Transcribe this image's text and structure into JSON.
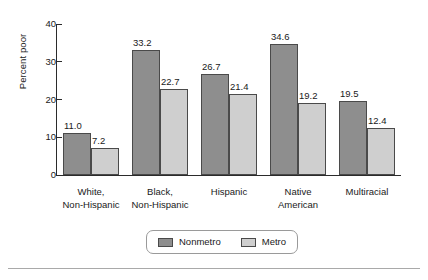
{
  "chart_data": {
    "type": "bar",
    "title": "",
    "xlabel": "",
    "ylabel": "Percent poor",
    "ylim": [
      0,
      40
    ],
    "yticks": [
      "0",
      "10",
      "20",
      "30",
      "40"
    ],
    "grid": false,
    "legend_position": "bottom-center",
    "categories": [
      "White,\nNon-Hispanic",
      "Black,\nNon-Hispanic",
      "Hispanic",
      "Native\nAmerican",
      "Multiracial"
    ],
    "series": [
      {
        "name": "Nonmetro",
        "color": "#8e8e8e",
        "values": [
          11.0,
          33.2,
          26.7,
          34.6,
          19.5
        ],
        "value_labels": [
          "11.0",
          "33.2",
          "26.7",
          "34.6",
          "19.5"
        ]
      },
      {
        "name": "Metro",
        "color": "#cfcfcf",
        "values": [
          7.2,
          22.7,
          21.4,
          19.2,
          12.4
        ],
        "value_labels": [
          "7.2",
          "22.7",
          "21.4",
          "19.2",
          "12.4"
        ]
      }
    ]
  },
  "legend": {
    "items": [
      {
        "label": "Nonmetro",
        "color": "#8e8e8e"
      },
      {
        "label": "Metro",
        "color": "#cfcfcf"
      }
    ]
  },
  "colors": {
    "nonmetro": "#8e8e8e",
    "metro": "#cfcfcf",
    "axis": "#2b2b2b",
    "text": "#1a1a1a",
    "rule": "#a9a9a9"
  }
}
